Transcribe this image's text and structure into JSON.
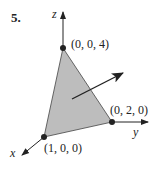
{
  "problem_number": "5.",
  "axes": {
    "x": "x",
    "y": "y",
    "z": "z"
  },
  "vertices": [
    {
      "label": "(0, 0, 4)"
    },
    {
      "label": "(0, 2, 0)"
    },
    {
      "label": "(1, 0, 0)"
    }
  ],
  "colors": {
    "plane_fill": "#bdbdbd",
    "line": "#222222"
  }
}
